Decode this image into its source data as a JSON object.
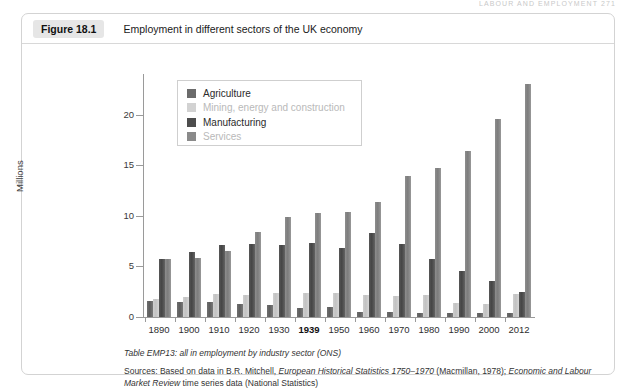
{
  "running_head": "LABOUR AND EMPLOYMENT  271",
  "figure": {
    "number": "Figure 18.1",
    "title": "Employment in different sectors of the UK economy"
  },
  "notes": {
    "table_note": "Table EMP13: all in employment by industry sector (ONS)",
    "sources_prefix": "Sources: Based on data in B.R. Mitchell, ",
    "sources_italic1": "European Historical Statistics 1750–1970",
    "sources_mid": " (Macmillan, 1978); ",
    "sources_italic2": "Economic and Labour Market Review",
    "sources_suffix": " time series data (National Statistics)"
  },
  "chart_data": {
    "type": "bar",
    "title": "Employment in different sectors of the UK economy",
    "xlabel": "",
    "ylabel": "Millions",
    "ylim": [
      0,
      24
    ],
    "yticks": [
      0,
      5,
      10,
      15,
      20
    ],
    "ytick_labels": [
      "0",
      "5",
      "10",
      "15",
      "20"
    ],
    "grid": false,
    "legend_position": "upper-left-inside",
    "categories": [
      "1890",
      "1900",
      "1910",
      "1920",
      "1930",
      "1939",
      "1950",
      "1960",
      "1970",
      "1980",
      "1990",
      "2000",
      "2012"
    ],
    "emphasized_category": "1939",
    "series": [
      {
        "name": "Agriculture",
        "color": "#6b6b6b",
        "values": [
          1.6,
          1.5,
          1.5,
          1.3,
          1.2,
          0.85,
          0.95,
          0.5,
          0.45,
          0.4,
          0.35,
          0.35,
          0.4
        ]
      },
      {
        "name": "Mining, energy and construction",
        "color": "#d2d2d2",
        "values": [
          1.8,
          2.0,
          2.3,
          2.2,
          2.35,
          2.35,
          2.35,
          2.2,
          2.1,
          2.2,
          1.4,
          1.3,
          2.3
        ]
      },
      {
        "name": "Manufacturing",
        "color": "#4d4d4d",
        "values": [
          5.75,
          6.4,
          7.15,
          7.25,
          7.15,
          7.3,
          6.85,
          8.3,
          7.2,
          5.7,
          4.5,
          3.6,
          2.5
        ]
      },
      {
        "name": "Services",
        "color": "#8a8a8a",
        "values": [
          5.7,
          5.8,
          6.5,
          8.4,
          9.85,
          10.3,
          10.35,
          11.4,
          13.95,
          14.75,
          16.4,
          19.6,
          23.0
        ]
      }
    ]
  }
}
